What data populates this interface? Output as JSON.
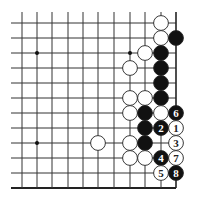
{
  "board": {
    "name": "go-diagram",
    "columns_x": [
      22,
      37,
      52,
      68,
      83,
      98,
      114,
      130,
      145,
      161,
      176
    ],
    "rows_y": [
      23,
      38,
      53,
      68,
      83,
      98,
      113,
      128,
      143,
      158,
      173,
      188
    ],
    "line_left": 11,
    "line_top": 12,
    "edges": {
      "right": true,
      "bottom": true
    },
    "colors": {
      "line": "#333333",
      "black": "#111111",
      "white": "#ffffff",
      "edge": "#222222"
    },
    "stone_radius": 7.4,
    "star_points": [
      {
        "col": 2,
        "row": 3
      },
      {
        "col": 8,
        "row": 3
      },
      {
        "col": 2,
        "row": 9
      }
    ],
    "stones": [
      {
        "color": "white",
        "col": 10,
        "row": 1,
        "label": ""
      },
      {
        "color": "white",
        "col": 10,
        "row": 2,
        "label": ""
      },
      {
        "color": "black",
        "col": 11,
        "row": 2,
        "label": ""
      },
      {
        "color": "white",
        "col": 9,
        "row": 3,
        "label": ""
      },
      {
        "color": "black",
        "col": 10,
        "row": 3,
        "label": ""
      },
      {
        "color": "white",
        "col": 8,
        "row": 4,
        "label": ""
      },
      {
        "color": "black",
        "col": 10,
        "row": 4,
        "label": ""
      },
      {
        "color": "black",
        "col": 10,
        "row": 5,
        "label": ""
      },
      {
        "color": "white",
        "col": 8,
        "row": 6,
        "label": ""
      },
      {
        "color": "white",
        "col": 9,
        "row": 6,
        "label": ""
      },
      {
        "color": "black",
        "col": 10,
        "row": 6,
        "label": ""
      },
      {
        "color": "white",
        "col": 8,
        "row": 7,
        "label": ""
      },
      {
        "color": "black",
        "col": 9,
        "row": 7,
        "label": ""
      },
      {
        "color": "white",
        "col": 10,
        "row": 7,
        "label": ""
      },
      {
        "color": "black",
        "col": 11,
        "row": 7,
        "label": "6"
      },
      {
        "color": "black",
        "col": 9,
        "row": 8,
        "label": ""
      },
      {
        "color": "black",
        "col": 10,
        "row": 8,
        "label": "2"
      },
      {
        "color": "white",
        "col": 11,
        "row": 8,
        "label": "1"
      },
      {
        "color": "white",
        "col": 6,
        "row": 9,
        "label": ""
      },
      {
        "color": "white",
        "col": 8,
        "row": 9,
        "label": ""
      },
      {
        "color": "black",
        "col": 9,
        "row": 9,
        "label": ""
      },
      {
        "color": "white",
        "col": 11,
        "row": 9,
        "label": "3"
      },
      {
        "color": "white",
        "col": 8,
        "row": 10,
        "label": ""
      },
      {
        "color": "white",
        "col": 9,
        "row": 10,
        "label": ""
      },
      {
        "color": "black",
        "col": 10,
        "row": 10,
        "label": "4"
      },
      {
        "color": "white",
        "col": 11,
        "row": 10,
        "label": "7"
      },
      {
        "color": "white",
        "col": 10,
        "row": 11,
        "label": "5"
      },
      {
        "color": "black",
        "col": 11,
        "row": 11,
        "label": "8"
      }
    ]
  }
}
